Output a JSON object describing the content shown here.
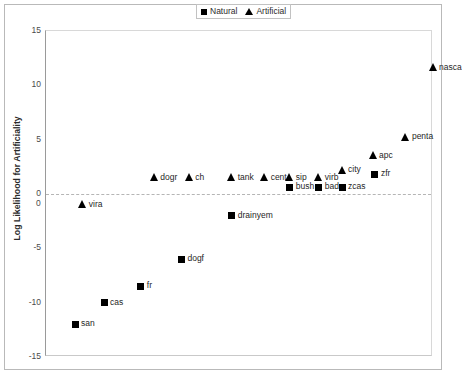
{
  "chart_data": {
    "type": "scatter",
    "title": "",
    "xlabel": "",
    "ylabel": "Log Likelihood for Artificiality",
    "ylim": [
      -15,
      15
    ],
    "yticks": [
      15,
      10,
      5,
      0,
      -5,
      -10,
      -15
    ],
    "xlim": [
      0,
      20
    ],
    "xticks": [
      0
    ],
    "grid": false,
    "zero_reference_line": true,
    "legend_position": "top-center",
    "legend": [
      {
        "name": "Natural",
        "marker": "square"
      },
      {
        "name": "Artificial",
        "marker": "triangle"
      }
    ],
    "series": [
      {
        "name": "Natural",
        "marker": "square",
        "points": [
          {
            "label": "san",
            "x": 1.5,
            "y": -12.0
          },
          {
            "label": "cas",
            "x": 3.0,
            "y": -10.0
          },
          {
            "label": "fr",
            "x": 4.9,
            "y": -8.5
          },
          {
            "label": "dogf",
            "x": 7.0,
            "y": -6.0
          },
          {
            "label": "drainyem",
            "x": 9.6,
            "y": -2.0
          },
          {
            "label": "bush",
            "x": 12.6,
            "y": 0.6
          },
          {
            "label": "bad",
            "x": 14.1,
            "y": 0.6
          },
          {
            "label": "zcas",
            "x": 15.3,
            "y": 0.6
          },
          {
            "label": "zfr",
            "x": 17.0,
            "y": 1.8
          }
        ]
      },
      {
        "name": "Artificial",
        "marker": "triangle",
        "points": [
          {
            "label": "vira",
            "x": 1.9,
            "y": -1.0
          },
          {
            "label": "dogr",
            "x": 5.6,
            "y": 1.5
          },
          {
            "label": "ch",
            "x": 7.4,
            "y": 1.5
          },
          {
            "label": "tank",
            "x": 9.6,
            "y": 1.5
          },
          {
            "label": "cent",
            "x": 11.3,
            "y": 1.5
          },
          {
            "label": "sip",
            "x": 12.6,
            "y": 1.5
          },
          {
            "label": "virb",
            "x": 14.1,
            "y": 1.5
          },
          {
            "label": "city",
            "x": 15.3,
            "y": 2.2
          },
          {
            "label": "apc",
            "x": 16.9,
            "y": 3.5
          },
          {
            "label": "penta",
            "x": 18.6,
            "y": 5.2
          },
          {
            "label": "nasca",
            "x": 20.0,
            "y": 11.6
          }
        ]
      }
    ]
  },
  "axis": {
    "ytick_labels": [
      "15",
      "10",
      "5",
      "0",
      "-5",
      "-10",
      "-15"
    ],
    "origin_label": "0",
    "ylabel": "Log Likelihood for Artificiality"
  }
}
